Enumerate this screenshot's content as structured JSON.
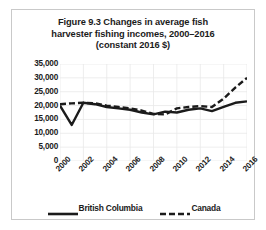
{
  "figure": {
    "title_lines": [
      "Figure 9.3 Changes in average fish",
      "harvester fishing incomes, 2000–2016",
      "(constant 2016 $)"
    ]
  },
  "chart_data": {
    "type": "line",
    "title": "Figure 9.3 Changes in average fish harvester fishing incomes, 2000–2016 (constant 2016 $)",
    "xlabel": "",
    "ylabel": "",
    "ylim": [
      0,
      35000
    ],
    "ytick_values": [
      0,
      5000,
      10000,
      15000,
      20000,
      25000,
      30000,
      35000
    ],
    "ytick_labels": [
      "0",
      "5,000",
      "10,000",
      "15,000",
      "20,000",
      "25,000",
      "30,000",
      "35,000"
    ],
    "xlim": [
      2000,
      2016
    ],
    "xtick_values": [
      2000,
      2002,
      2004,
      2006,
      2008,
      2010,
      2012,
      2014,
      2016
    ],
    "xtick_labels": [
      "2000",
      "2002",
      "2004",
      "2006",
      "2008",
      "2010",
      "2012",
      "2014",
      "2016"
    ],
    "x": [
      2000,
      2001,
      2002,
      2003,
      2004,
      2005,
      2006,
      2007,
      2008,
      2009,
      2010,
      2011,
      2012,
      2013,
      2014,
      2015,
      2016
    ],
    "grid": true,
    "legend_position": "bottom",
    "series": [
      {
        "name": "British Columbia",
        "style": "solid",
        "color": "#1b1b1b",
        "values": [
          20000,
          13000,
          21000,
          20500,
          19500,
          19000,
          18500,
          17500,
          16800,
          17800,
          17500,
          18500,
          19000,
          18000,
          19500,
          21000,
          21500
        ]
      },
      {
        "name": "Canada",
        "style": "dashed",
        "color": "#1b1b1b",
        "values": [
          20500,
          20800,
          21000,
          20800,
          20000,
          19500,
          19000,
          18200,
          17000,
          16800,
          19000,
          19500,
          19800,
          19500,
          22500,
          26500,
          30000
        ]
      }
    ]
  },
  "legend": {
    "items": [
      {
        "label": "British Columbia",
        "style": "solid"
      },
      {
        "label": "Canada",
        "style": "dashed"
      }
    ]
  },
  "colors": {
    "line": "#1b1b1b",
    "grid": "#e8e8e8",
    "frame": "#c9c9c9",
    "text": "#1b1b1b"
  }
}
